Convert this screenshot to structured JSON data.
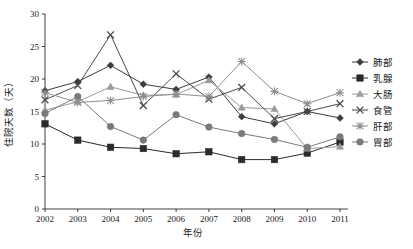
{
  "chart_data": {
    "type": "line",
    "title": "",
    "xlabel": "年份",
    "ylabel": "住院天数（天）",
    "xlim": [
      2002,
      2011
    ],
    "ylim": [
      0,
      30
    ],
    "ytick_values": [
      0,
      5,
      10,
      15,
      20,
      25,
      30
    ],
    "ytick_labels": [
      "0",
      "5",
      "10",
      "15",
      "20",
      "25",
      "30"
    ],
    "grid": false,
    "legend_position": "right",
    "categories": [
      "2002",
      "2003",
      "2004",
      "2005",
      "2006",
      "2007",
      "2008",
      "2009",
      "2010",
      "2011"
    ],
    "series": [
      {
        "name": "肺部",
        "marker": "diamond",
        "color": "#3d3d3d",
        "values": [
          18.2,
          19.6,
          22.1,
          19.2,
          18.4,
          20.3,
          14.2,
          13.1,
          15.0,
          14.0
        ]
      },
      {
        "name": "乳腺",
        "marker": "square",
        "color": "#2b2b2b",
        "values": [
          13.1,
          10.6,
          9.5,
          9.3,
          8.5,
          8.8,
          7.6,
          7.6,
          8.6,
          10.3
        ]
      },
      {
        "name": "大肠",
        "marker": "triangle",
        "color": "#9a9a9a",
        "values": [
          15.2,
          16.5,
          18.8,
          17.5,
          17.6,
          19.8,
          15.6,
          15.4,
          9.3,
          9.6
        ]
      },
      {
        "name": "食管",
        "marker": "cross",
        "color": "#4a4a4a",
        "values": [
          16.8,
          19.0,
          26.8,
          15.9,
          20.8,
          16.9,
          18.7,
          13.9,
          15.0,
          16.2
        ]
      },
      {
        "name": "肝部",
        "marker": "star",
        "color": "#8f8f8f",
        "values": [
          17.9,
          16.4,
          16.7,
          17.3,
          17.7,
          17.3,
          22.7,
          18.1,
          16.2,
          17.9
        ]
      },
      {
        "name": "胃部",
        "marker": "circle",
        "color": "#7a7a7a",
        "values": [
          14.7,
          17.3,
          12.7,
          10.6,
          14.5,
          12.6,
          11.6,
          10.7,
          9.5,
          11.1
        ]
      }
    ]
  }
}
